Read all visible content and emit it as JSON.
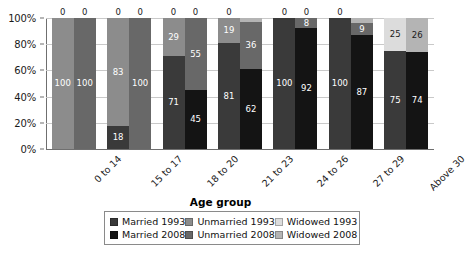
{
  "chart_data": {
    "type": "bar",
    "subtype": "stacked-percent-grouped",
    "title": "",
    "xlabel": "Age group",
    "ylabel": "",
    "ylim": [
      0,
      100
    ],
    "yticks": [
      "0%",
      "20%",
      "40%",
      "60%",
      "80%",
      "100%"
    ],
    "ytick_values": [
      0,
      20,
      40,
      60,
      80,
      100
    ],
    "grid": true,
    "legend_position": "bottom",
    "categories": [
      "0 to 14",
      "15 to 17",
      "18 to 20",
      "21 to 23",
      "24 to 26",
      "27 to 29",
      "Above 30"
    ],
    "series": [
      {
        "name": "Married 1993",
        "year": "1993",
        "status": "Married",
        "color": "#3a3a3a",
        "values": [
          0,
          18,
          71,
          81,
          100,
          100,
          75
        ]
      },
      {
        "name": "Unmarried 1993",
        "year": "1993",
        "status": "Unmarried",
        "color": "#8c8c8c",
        "values": [
          100,
          83,
          29,
          19,
          0,
          0,
          0
        ]
      },
      {
        "name": "Widowed 1993",
        "year": "1993",
        "status": "Widowed",
        "color": "#dcdcdc",
        "values": [
          0,
          0,
          0,
          0,
          0,
          0,
          25
        ]
      },
      {
        "name": "Married 2008",
        "year": "2008",
        "status": "Married",
        "color": "#141414",
        "values": [
          0,
          0,
          45,
          62,
          92,
          87,
          74
        ]
      },
      {
        "name": "Unmarried 2008",
        "year": "2008",
        "status": "Unmarried",
        "color": "#686868",
        "values": [
          100,
          100,
          55,
          36,
          8,
          9,
          0
        ]
      },
      {
        "name": "Widowed 2008",
        "year": "2008",
        "status": "Widowed",
        "color": "#b4b4b4",
        "values": [
          0,
          0,
          0,
          3,
          0,
          4,
          26
        ]
      }
    ],
    "bar_labels": {
      "1993": [
        [
          "0.5",
          "100",
          "0"
        ],
        [
          "18",
          "83",
          "0"
        ],
        [
          "71",
          "29",
          "0"
        ],
        [
          "81",
          "19",
          "0"
        ],
        [
          "100",
          "0",
          "0"
        ],
        [
          "100",
          "0",
          "0"
        ],
        [
          "75",
          "0",
          "25"
        ]
      ],
      "2008": [
        [
          "0",
          "100",
          "0"
        ],
        [
          "0",
          "100",
          "0"
        ],
        [
          "45",
          "55",
          "0"
        ],
        [
          "62",
          "36",
          "3"
        ],
        [
          "92",
          "8",
          "0"
        ],
        [
          "87",
          "9",
          "4"
        ],
        [
          "74",
          "1",
          "26"
        ]
      ]
    }
  },
  "legend": {
    "rows": [
      [
        {
          "label": "Married 1993",
          "color": "#3a3a3a"
        },
        {
          "label": "Unmarried 1993",
          "color": "#8c8c8c"
        },
        {
          "label": "Widowed 1993",
          "color": "#dcdcdc"
        }
      ],
      [
        {
          "label": "Married 2008",
          "color": "#141414"
        },
        {
          "label": "Unmarried 2008",
          "color": "#686868"
        },
        {
          "label": "Widowed 2008",
          "color": "#b4b4b4"
        }
      ]
    ]
  },
  "axis": {
    "x_title": "Age group"
  }
}
